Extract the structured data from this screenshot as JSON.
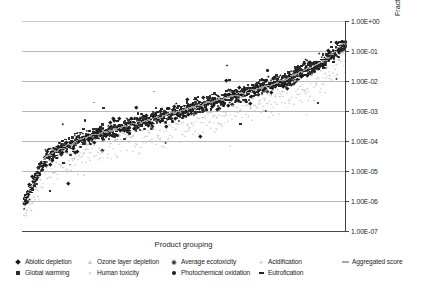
{
  "chart_data": {
    "type": "scatter",
    "title": "",
    "xlabel": "Product grouping",
    "ylabel": "Fractions of total impacts EU-25, logarithmic scale",
    "yscale": "log",
    "ylim": [
      1e-07,
      1.0
    ],
    "ytick_labels": [
      "1.00E+00",
      "1.00E-01",
      "1.00E-02",
      "1.00E-03",
      "1.00E-04",
      "1.00E-05",
      "1.00E-06",
      "1.00E-07"
    ],
    "ytick_values": [
      1,
      0.1,
      0.01,
      0.001,
      0.0001,
      1e-05,
      1e-06,
      1e-07
    ],
    "xtick_labels": [],
    "grid": "horizontal",
    "legend_position": "bottom",
    "series": [
      {
        "name": "Abiotic depletion",
        "marker": "diamond",
        "color": "#1a1a1a"
      },
      {
        "name": "Global warming",
        "marker": "square",
        "color": "#2b2b2b"
      },
      {
        "name": "Ozone layer depletion",
        "marker": "triangle",
        "color": "#c8c8c8"
      },
      {
        "name": "Human toxicity",
        "marker": "x",
        "color": "#c0c0c0"
      },
      {
        "name": "Average ecotoxicity",
        "marker": "star",
        "color": "#111111"
      },
      {
        "name": "Photochemical oxidation",
        "marker": "circle",
        "color": "#1c1c1c"
      },
      {
        "name": "Acidification",
        "marker": "plus",
        "color": "#b0b0b0"
      },
      {
        "name": "Eutrofication",
        "marker": "dash",
        "color": "#262626"
      },
      {
        "name": "Aggregated score",
        "marker": "line",
        "color": "#a8a8a8"
      }
    ],
    "x_range_note": "Product groupings sorted by aggregated score, unlabeled categorical axis",
    "value_range": {
      "min": 7e-07,
      "max": 0.22
    }
  },
  "legend": {
    "rows": [
      [
        {
          "label": "Abiotic depletion",
          "marker": "diamond"
        },
        {
          "label": "Ozone layer depletion",
          "marker": "triangle"
        },
        {
          "label": "Average ecotoxicity",
          "marker": "star"
        },
        {
          "label": "Acidification",
          "marker": "plus"
        },
        {
          "label": "Aggregated score",
          "marker": "line"
        }
      ],
      [
        {
          "label": "Global warming",
          "marker": "square"
        },
        {
          "label": "Human toxicity",
          "marker": "x"
        },
        {
          "label": "Photochemical oxidation",
          "marker": "circle"
        },
        {
          "label": "Eutrofication",
          "marker": "dash"
        }
      ]
    ]
  },
  "glyphs": {
    "x_mark": "×",
    "star_mark": "✳",
    "plus_mark": "+"
  }
}
